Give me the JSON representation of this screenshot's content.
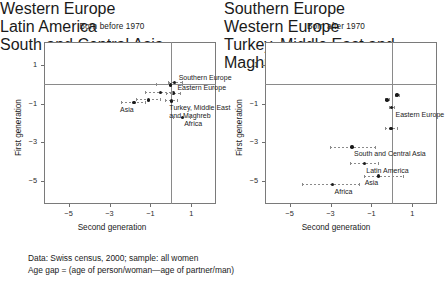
{
  "figure": {
    "caption_line_1": "Data: Swiss census, 2000; sample: all women",
    "caption_line_2": "Age gap = (age of person/woman—age of partner/man)"
  },
  "axes": {
    "xlabel": "Second generation",
    "ylabel": "First generation",
    "xticks": [
      "−5",
      "−3",
      "−1",
      "1"
    ],
    "yticks": [
      "1",
      "−1",
      "−3",
      "−5"
    ]
  },
  "chart_data": {
    "type": "scatter",
    "xlabel": "Second generation",
    "ylabel": "First generation",
    "xlim": [
      -6.2,
      2.2
    ],
    "ylim": [
      -6.2,
      2.2
    ],
    "xticks": [
      -5,
      -3,
      -1,
      1
    ],
    "yticks": [
      1,
      -1,
      -3,
      -5
    ],
    "grid": false,
    "legend": "none",
    "reference_lines": {
      "x": 0,
      "y": 0
    },
    "panels": [
      {
        "title": "Born before 1970",
        "points": [
          {
            "label": "Southern Europe",
            "x": 0.18,
            "y": 0.1,
            "ci": [
              -0.15,
              0.55
            ],
            "label_pos": "right-stack"
          },
          {
            "label": "Western Europe",
            "x": -0.02,
            "y": -0.02,
            "ci": [
              -0.75,
              0.55
            ],
            "label_pos": "left"
          },
          {
            "label": "Eastern Europe",
            "x": 0.12,
            "y": -0.45,
            "ci": [
              -0.25,
              0.45
            ],
            "label_pos": "right-stack"
          },
          {
            "label": "Latin America",
            "x": -0.52,
            "y": -0.42,
            "ci": [
              -1.25,
              0.05
            ],
            "label_pos": "left"
          },
          {
            "label": "South and Central Asia",
            "x": -1.1,
            "y": -0.8,
            "ci": [
              -1.7,
              -0.55
            ],
            "label_pos": "left"
          },
          {
            "label": "Asia",
            "x": -1.8,
            "y": -0.95,
            "ci": [
              -2.45,
              -1.25
            ],
            "label_pos": "below"
          },
          {
            "label": "Turkey, Middle East and Maghreb",
            "x": 0.02,
            "y": -0.85,
            "ci": [
              -0.3,
              0.3
            ],
            "label_pos": "below-right-stack"
          },
          {
            "label": "Africa",
            "x": 0.55,
            "y": -1.7,
            "ci": [
              0.1,
              0.95
            ],
            "label_pos": "below-right"
          }
        ]
      },
      {
        "title": "Born after 1970",
        "points": [
          {
            "label": "Southern Europe",
            "x": 0.25,
            "y": -0.55,
            "ci": [
              0.15,
              0.35
            ],
            "label_pos": "left"
          },
          {
            "label": "Western Europe",
            "x": -0.25,
            "y": -0.8,
            "ci": [
              -0.35,
              -0.15
            ],
            "label_pos": "left"
          },
          {
            "label": "Eastern Europe",
            "x": -0.02,
            "y": -1.2,
            "ci": [
              -0.12,
              0.08
            ],
            "label_pos": "right-below"
          },
          {
            "label": "Turkey, Middle East and Maghreb",
            "x": -0.05,
            "y": -2.3,
            "ci": [
              -0.35,
              0.25
            ],
            "label_pos": "left"
          },
          {
            "label": "South and Central Asia",
            "x": -1.95,
            "y": -3.25,
            "ci": [
              -3.05,
              -0.85
            ],
            "label_pos": "below-right"
          },
          {
            "label": "Latin America",
            "x": -1.35,
            "y": -4.1,
            "ci": [
              -2.05,
              -0.7
            ],
            "label_pos": "below-right"
          },
          {
            "label": "Asia",
            "x": -0.65,
            "y": -4.75,
            "ci": [
              -1.35,
              0.55
            ],
            "label_pos": "below"
          },
          {
            "label": "Africa",
            "x": -2.9,
            "y": -5.2,
            "ci": [
              -4.4,
              -1.6
            ],
            "label_pos": "below-right"
          }
        ]
      }
    ]
  }
}
